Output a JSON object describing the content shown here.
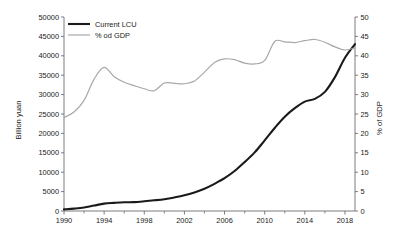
{
  "chart_data": {
    "type": "line",
    "title": "",
    "xlabel": "",
    "ylabel": "Billion yuan",
    "y2label": "% of GDP",
    "xlim": [
      1990,
      2019
    ],
    "ylim": [
      0,
      50000
    ],
    "y2lim": [
      0,
      50
    ],
    "grid": false,
    "legend_position": "top-left",
    "x": [
      1990,
      1991,
      1992,
      1993,
      1994,
      1995,
      1996,
      1997,
      1998,
      1999,
      2000,
      2001,
      2002,
      2003,
      2004,
      2005,
      2006,
      2007,
      2008,
      2009,
      2010,
      2011,
      2012,
      2013,
      2014,
      2015,
      2016,
      2017,
      2018,
      2019
    ],
    "xticks": [
      1990,
      1994,
      1998,
      2002,
      2006,
      2010,
      2014,
      2018
    ],
    "xticklabels": [
      "1990",
      "1994",
      "1998",
      "2002",
      "2006",
      "2010",
      "2014",
      "2018"
    ],
    "xticks_minor": [
      1992,
      1996,
      2000,
      2004,
      2008,
      2012,
      2016
    ],
    "yticks": [
      0,
      5000,
      10000,
      15000,
      20000,
      25000,
      30000,
      35000,
      40000,
      45000,
      50000
    ],
    "yticklabels": [
      "0",
      "5000",
      "10000",
      "15000",
      "20000",
      "25000",
      "30000",
      "35000",
      "40000",
      "45000",
      "50000"
    ],
    "y2ticks": [
      0,
      5,
      10,
      15,
      20,
      25,
      30,
      35,
      40,
      45,
      50
    ],
    "y2ticklabels": [
      "0",
      "5",
      "10",
      "15",
      "20",
      "25",
      "30",
      "35",
      "40",
      "45",
      "50"
    ],
    "series": [
      {
        "name": "Current LCU",
        "axis": "left",
        "color": "#1a1a1a",
        "width": 2.1,
        "values": [
          420,
          620,
          900,
          1400,
          1900,
          2100,
          2250,
          2300,
          2500,
          2750,
          3050,
          3500,
          4050,
          4800,
          5750,
          7000,
          8450,
          10300,
          12600,
          15100,
          18200,
          21400,
          24300,
          26500,
          28200,
          28900,
          30700,
          34500,
          39500,
          43000
        ]
      },
      {
        "name": "% od GDP",
        "axis": "right",
        "color": "#a8a8a8",
        "width": 1.2,
        "values": [
          24.1,
          25.5,
          28.5,
          34.0,
          37.0,
          34.6,
          33.2,
          32.3,
          31.5,
          31.0,
          33.0,
          32.9,
          32.8,
          33.5,
          35.8,
          38.3,
          39.2,
          39.0,
          38.1,
          37.9,
          38.8,
          43.7,
          43.6,
          43.4,
          43.9,
          44.2,
          43.5,
          42.3,
          41.5,
          42.0
        ]
      }
    ]
  },
  "legend": {
    "items": [
      {
        "label": "Current LCU"
      },
      {
        "label": "% od GDP"
      }
    ]
  },
  "axes": {
    "left_title": "Billion yuan",
    "right_title": "% of GDP"
  }
}
